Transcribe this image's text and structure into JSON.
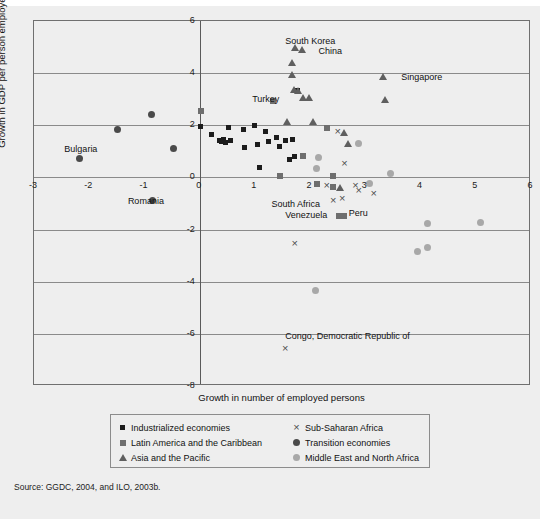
{
  "axes": {
    "xlabel": "Growth in number of employed persons",
    "ylabel": "Growth in GDP per person employed",
    "xticks": [
      "-3",
      "-2",
      "-1",
      "0",
      "1",
      "2",
      "3",
      "4",
      "5",
      "6"
    ],
    "yticks": [
      "6",
      "4",
      "2",
      "0",
      "-2",
      "-4",
      "-6",
      "-8"
    ]
  },
  "source": "Source: GGDC, 2004, and ILO, 2003b.",
  "legend": {
    "left": [
      {
        "label": "Industrialized economies",
        "marker": "square-black"
      },
      {
        "label": "Latin America and the Caribbean",
        "marker": "square-gray"
      },
      {
        "label": "Asia and the Pacific",
        "marker": "triangle-gray"
      }
    ],
    "right": [
      {
        "label": "Sub-Saharan Africa",
        "marker": "x-gray"
      },
      {
        "label": "Transition economies",
        "marker": "circle-dark"
      },
      {
        "label": "Middle East and North Africa",
        "marker": "circle-light"
      }
    ]
  },
  "annotations": [
    {
      "text": "South Korea",
      "x": 1.55,
      "y": 5.25
    },
    {
      "text": "China",
      "x": 2.15,
      "y": 4.85
    },
    {
      "text": "Singapore",
      "x": 3.65,
      "y": 3.85
    },
    {
      "text": "Turkey",
      "x": 0.95,
      "y": 3.0
    },
    {
      "text": "Bulgaria",
      "x": -2.45,
      "y": 1.1
    },
    {
      "text": "Romania",
      "x": -1.3,
      "y": -0.9
    },
    {
      "text": "South Africa",
      "x": 1.3,
      "y": -1.0
    },
    {
      "text": "Venezuela",
      "x": 1.55,
      "y": -1.45
    },
    {
      "text": "Peru",
      "x": 2.7,
      "y": -1.38
    },
    {
      "text": "Congo, Democratic Republic of",
      "x": 1.55,
      "y": -6.1
    }
  ],
  "chart_data": {
    "type": "scatter",
    "title": "",
    "xlabel": "Growth in number of employed persons",
    "ylabel": "Growth in GDP per person employed",
    "xlim": [
      -3,
      6
    ],
    "ylim": [
      -8,
      6
    ],
    "xticks": [
      -3,
      -2,
      -1,
      0,
      1,
      2,
      3,
      4,
      5,
      6
    ],
    "yticks": [
      -8,
      -6,
      -4,
      -2,
      0,
      2,
      4,
      6
    ],
    "grid": "horizontal",
    "legend_position": "below-plot",
    "series": [
      {
        "name": "Industrialized economies",
        "marker": "square-black",
        "color": "#1c1c1c",
        "points": [
          [
            0.02,
            1.95
          ],
          [
            0.22,
            1.65
          ],
          [
            0.36,
            1.42
          ],
          [
            0.4,
            1.38
          ],
          [
            0.44,
            1.45
          ],
          [
            0.47,
            1.35
          ],
          [
            0.52,
            1.92
          ],
          [
            0.55,
            1.4
          ],
          [
            0.8,
            1.82
          ],
          [
            0.82,
            1.15
          ],
          [
            1.0,
            1.98
          ],
          [
            1.05,
            1.28
          ],
          [
            1.08,
            0.4
          ],
          [
            1.2,
            1.78
          ],
          [
            1.25,
            1.38
          ],
          [
            1.4,
            1.55
          ],
          [
            1.45,
            1.18
          ],
          [
            1.55,
            1.4
          ],
          [
            1.62,
            0.68
          ],
          [
            1.68,
            1.45
          ],
          [
            1.72,
            0.82
          ],
          [
            1.78,
            3.35
          ]
        ]
      },
      {
        "name": "Latin America and the Caribbean",
        "marker": "square-gray",
        "color": "#6e6e6e",
        "points": [
          [
            0.02,
            2.55
          ],
          [
            1.32,
            2.92
          ],
          [
            1.45,
            0.05
          ],
          [
            1.88,
            0.82
          ],
          [
            2.12,
            -0.25
          ],
          [
            2.3,
            1.88
          ],
          [
            2.42,
            0.07
          ],
          [
            2.42,
            -0.35
          ],
          [
            2.52,
            -1.48
          ],
          [
            2.62,
            -1.48
          ]
        ]
      },
      {
        "name": "Asia and the Pacific",
        "marker": "triangle-gray",
        "color": "#5f5f5f",
        "points": [
          [
            1.72,
            4.98
          ],
          [
            1.85,
            4.92
          ],
          [
            1.68,
            4.42
          ],
          [
            1.68,
            3.95
          ],
          [
            1.7,
            3.38
          ],
          [
            1.78,
            3.32
          ],
          [
            1.88,
            3.08
          ],
          [
            1.98,
            3.08
          ],
          [
            1.58,
            2.15
          ],
          [
            2.05,
            2.15
          ],
          [
            2.62,
            1.72
          ],
          [
            2.68,
            1.32
          ],
          [
            3.32,
            3.88
          ],
          [
            3.35,
            2.98
          ],
          [
            2.55,
            -0.38
          ]
        ]
      },
      {
        "name": "Sub-Saharan Africa",
        "marker": "x-gray",
        "color": "#4e4e4e",
        "points": [
          [
            2.5,
            1.78
          ],
          [
            2.62,
            0.52
          ],
          [
            2.3,
            -0.3
          ],
          [
            2.42,
            -0.9
          ],
          [
            2.58,
            -0.8
          ],
          [
            2.82,
            -0.3
          ],
          [
            2.88,
            -0.52
          ],
          [
            3.15,
            -0.62
          ],
          [
            1.72,
            -2.55
          ],
          [
            1.55,
            -6.55
          ]
        ]
      },
      {
        "name": "Transition economies",
        "marker": "circle-dark",
        "color": "#4a4a4a",
        "points": [
          [
            -2.18,
            0.72
          ],
          [
            -1.48,
            1.82
          ],
          [
            -0.88,
            2.42
          ],
          [
            -0.48,
            1.12
          ],
          [
            -0.85,
            -0.9
          ]
        ]
      },
      {
        "name": "Middle East and North Africa",
        "marker": "circle-light",
        "color": "#a8a8a8",
        "points": [
          [
            2.88,
            1.32
          ],
          [
            2.15,
            0.75
          ],
          [
            2.12,
            0.35
          ],
          [
            3.45,
            0.15
          ],
          [
            3.08,
            -0.22
          ],
          [
            4.12,
            -1.78
          ],
          [
            5.08,
            -1.72
          ],
          [
            3.95,
            -2.85
          ],
          [
            4.12,
            -2.68
          ],
          [
            2.1,
            -4.32
          ]
        ]
      }
    ]
  }
}
